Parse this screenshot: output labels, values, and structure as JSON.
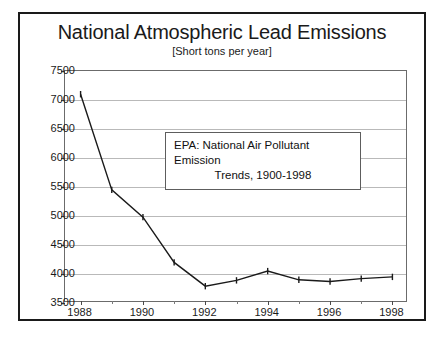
{
  "chart_data": {
    "type": "line",
    "title": "National Atmospheric Lead Emissions",
    "subtitle": "[Short tons per year]",
    "xlabel": "",
    "ylabel": "",
    "x": [
      1988,
      1989,
      1990,
      1991,
      1992,
      1993,
      1994,
      1995,
      1996,
      1997,
      1998
    ],
    "values": [
      7100,
      5450,
      4980,
      4200,
      3790,
      3890,
      4050,
      3900,
      3870,
      3920,
      3950
    ],
    "series": [
      {
        "name": "Lead emissions",
        "values": [
          7100,
          5450,
          4980,
          4200,
          3790,
          3890,
          4050,
          3900,
          3870,
          3920,
          3950
        ]
      }
    ],
    "xlim": [
      1987.5,
      1998.5
    ],
    "ylim": [
      3500,
      7500
    ],
    "ytick_labels": [
      "7500",
      "7000",
      "6500",
      "6000",
      "5500",
      "5000",
      "4500",
      "4000",
      "3500"
    ],
    "ytick_values": [
      7500,
      7000,
      6500,
      6000,
      5500,
      5000,
      4500,
      4000,
      3500
    ],
    "xtick_labels": [
      "1988",
      "1990",
      "1992",
      "1994",
      "1996",
      "1998"
    ],
    "xtick_values": [
      1988,
      1990,
      1992,
      1994,
      1996,
      1998
    ],
    "xtick_minor_values": [
      1989,
      1991,
      1993,
      1995,
      1997
    ],
    "grid": true,
    "legend": "none",
    "line_color": "#1a1a1a",
    "grid_color": "#b9b9b9",
    "annotations": [
      {
        "line1": "EPA: National Air Pollutant Emission",
        "line2": "Trends, 1900-1998"
      }
    ]
  }
}
